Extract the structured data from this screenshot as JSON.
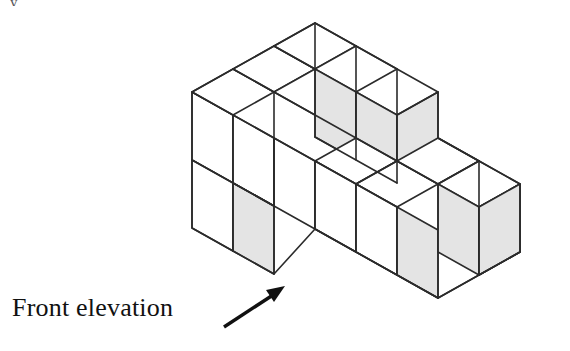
{
  "figure": {
    "caption": "Front elevation",
    "corner_mark": "y",
    "colors": {
      "background": "#ffffff",
      "stroke": "#2b2b2b",
      "face_light": "#ffffff",
      "face_shaded": "#e4e4e4",
      "arrow": "#111111",
      "text": "#111111"
    },
    "stroke_width": 1.6,
    "projection": {
      "type": "isometric",
      "x_axis_px": [
        41,
        23
      ],
      "y_axis_px": [
        -41,
        23
      ],
      "z_axis_px": [
        0,
        -68
      ],
      "origin_px": [
        318,
        17
      ]
    },
    "arrow": {
      "from": [
        224,
        327
      ],
      "to": [
        283,
        288
      ],
      "head_length": 17,
      "head_width": 11
    },
    "faces": [
      {
        "name": "top-back-left-roof",
        "shade": "light",
        "points": "192,92 233,69 274,92 233,115"
      },
      {
        "name": "top-back-right-roof",
        "shade": "light",
        "points": "233,69 274,46 315,69 274,92"
      },
      {
        "name": "top-apex-left",
        "shade": "light",
        "points": "274,46 315,23 356,46 315,69"
      },
      {
        "name": "top-apex-right",
        "shade": "light",
        "points": "315,69 356,46 397,69 356,92"
      },
      {
        "name": "top-mid-step-left",
        "shade": "light",
        "points": "274,92 315,69 356,92 315,115"
      },
      {
        "name": "top-mid-step-right",
        "shade": "light",
        "points": "315,115 356,92 397,115 356,138"
      },
      {
        "name": "top-lower-front-left",
        "shade": "light",
        "points": "315,161 356,138 397,161 356,184"
      },
      {
        "name": "top-lower-front-right",
        "shade": "light",
        "points": "356,184 397,161 438,184 397,207"
      },
      {
        "name": "top-right-block-a",
        "shade": "light",
        "points": "397,161 438,138 479,161 438,184"
      },
      {
        "name": "top-right-block-b",
        "shade": "light",
        "points": "438,184 479,161 520,184 479,207"
      },
      {
        "name": "left-upper-a",
        "shade": "light",
        "points": "192,92 233,115 233,183 192,160"
      },
      {
        "name": "left-upper-b",
        "shade": "light",
        "points": "233,115 274,138 274,206 233,183"
      },
      {
        "name": "left-lower-a",
        "shade": "light",
        "points": "192,160 233,183 233,251 192,228"
      },
      {
        "name": "left-lower-b",
        "shade": "shaded",
        "points": "233,183 274,206 274,274 233,251"
      },
      {
        "name": "front-upper-shaded-a",
        "shade": "shaded",
        "points": "315,69 356,92 356,160 315,137"
      },
      {
        "name": "front-upper-shaded-b",
        "shade": "shaded",
        "points": "356,92 397,115 397,183 356,160"
      },
      {
        "name": "front-mid-left-white",
        "shade": "light",
        "points": "274,138 315,161 315,229 274,206"
      },
      {
        "name": "front-mid-right-white",
        "shade": "light",
        "points": "315,161 356,184 356,252 315,229"
      },
      {
        "name": "front-low-left-white",
        "shade": "light",
        "points": "356,184 397,207 397,275 356,252"
      },
      {
        "name": "front-low-right-shaded",
        "shade": "shaded",
        "points": "397,207 438,230 438,298 397,275"
      },
      {
        "name": "right-face-upper-shaded",
        "shade": "shaded",
        "points": "397,115 438,92 438,160 397,183"
      },
      {
        "name": "right-block-face-a",
        "shade": "shaded",
        "points": "438,184 479,207 479,275 438,252"
      },
      {
        "name": "right-block-face-b",
        "shade": "shaded",
        "points": "479,207 520,184 520,252 479,275"
      }
    ]
  }
}
